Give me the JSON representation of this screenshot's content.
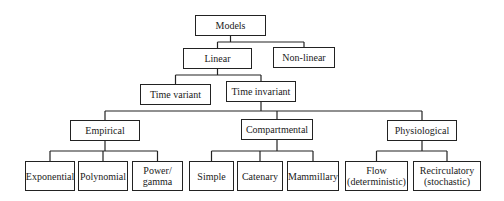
{
  "diagram": {
    "type": "tree",
    "nodes": [
      {
        "id": "models",
        "label": "Models",
        "parent": null
      },
      {
        "id": "linear",
        "label": "Linear",
        "parent": "models"
      },
      {
        "id": "nonlinear",
        "label": "Non-linear",
        "parent": "models"
      },
      {
        "id": "time-variant",
        "label": "Time variant",
        "parent": "linear"
      },
      {
        "id": "time-invariant",
        "label": "Time invariant",
        "parent": "linear"
      },
      {
        "id": "empirical",
        "label": "Empirical",
        "parent": "time-invariant"
      },
      {
        "id": "compartmental",
        "label": "Compartmental",
        "parent": "time-invariant"
      },
      {
        "id": "physiological",
        "label": "Physiological",
        "parent": "time-invariant"
      },
      {
        "id": "exponential",
        "label": "Exponential",
        "parent": "empirical"
      },
      {
        "id": "polynomial",
        "label": "Polynomial",
        "parent": "empirical"
      },
      {
        "id": "power-gamma",
        "label": "Power/\ngamma",
        "parent": "empirical"
      },
      {
        "id": "simple",
        "label": "Simple",
        "parent": "compartmental"
      },
      {
        "id": "catenary",
        "label": "Catenary",
        "parent": "compartmental"
      },
      {
        "id": "mammillary",
        "label": "Mammillary",
        "parent": "compartmental"
      },
      {
        "id": "flow",
        "label": "Flow\n(deterministic)",
        "parent": "physiological"
      },
      {
        "id": "recirculatory",
        "label": "Recirculatory\n(stochastic)",
        "parent": "physiological"
      }
    ]
  }
}
